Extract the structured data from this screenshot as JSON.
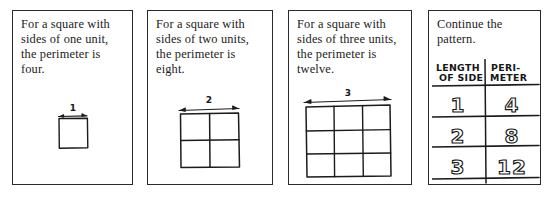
{
  "worksheet": {
    "title": "Perimeter of squares pattern",
    "ink_color": "#1b1b1b",
    "background_color": "#ffffff"
  },
  "panels": [
    {
      "id": "panel-1",
      "caption": "For a square with sides of one unit, the perimeter is four.",
      "figure": {
        "type": "square-grid",
        "divisions": 1,
        "dimension_label": "1",
        "arrow": "double-headed"
      }
    },
    {
      "id": "panel-2",
      "caption": "For a square with sides of two units, the perimeter is eight.",
      "figure": {
        "type": "square-grid",
        "divisions": 2,
        "dimension_label": "2",
        "arrow": "double-headed"
      }
    },
    {
      "id": "panel-3",
      "caption": "For a square with sides of three units, the perimeter is twelve.",
      "figure": {
        "type": "square-grid",
        "divisions": 3,
        "dimension_label": "3",
        "arrow": "double-headed"
      }
    },
    {
      "id": "panel-4",
      "caption": "Continue the pattern.",
      "table": {
        "headers": {
          "col1_line1": "LENGTH",
          "col1_line2": "OF SIDE",
          "col2_line1": "PERI-",
          "col2_line2": "METER"
        },
        "rows": [
          {
            "side": "1",
            "perimeter": "4"
          },
          {
            "side": "2",
            "perimeter": "8"
          },
          {
            "side": "3",
            "perimeter": "12"
          }
        ]
      }
    }
  ]
}
